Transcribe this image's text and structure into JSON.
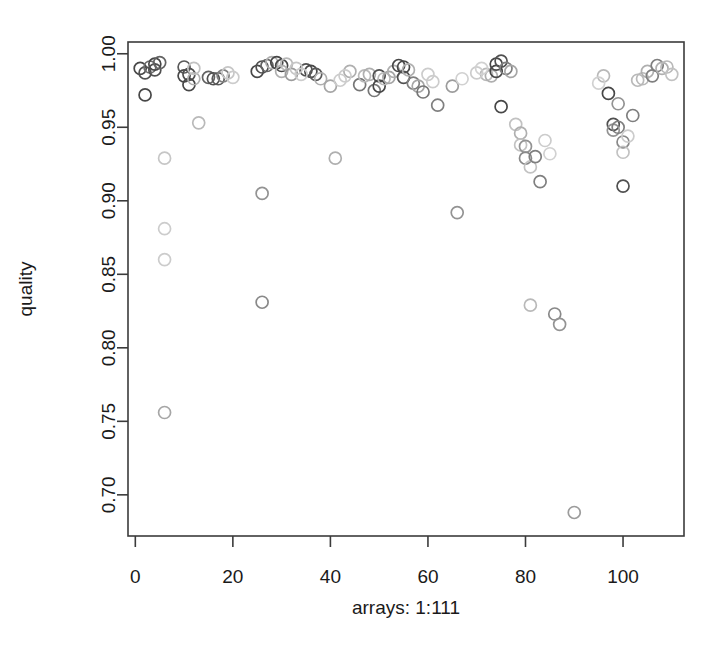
{
  "chart_data": {
    "type": "scatter",
    "title": "",
    "xlabel": "arrays: 1:111",
    "ylabel": "quality",
    "xlim": [
      -1.5,
      112.5
    ],
    "ylim": [
      0.672,
      1.008
    ],
    "xticks": [
      0,
      20,
      40,
      60,
      80,
      100
    ],
    "xtick_labels": [
      "0",
      "20",
      "40",
      "60",
      "80",
      "100"
    ],
    "yticks": [
      0.7,
      0.75,
      0.8,
      0.85,
      0.9,
      0.95,
      1.0
    ],
    "ytick_labels": [
      "0.70",
      "0.75",
      "0.80",
      "0.85",
      "0.90",
      "0.95",
      "1.00"
    ],
    "grid": false,
    "legend": null,
    "marker": "open-circle",
    "point_radius_px": 6,
    "note": "Point shading varies from light grey to dark grey; darkness encoded per point as 'shade' (0 = lightest, 1 = darkest).",
    "points": [
      {
        "x": 1,
        "y": 0.99,
        "shade": 0.85
      },
      {
        "x": 2,
        "y": 0.987,
        "shade": 0.8
      },
      {
        "x": 2,
        "y": 0.972,
        "shade": 0.85
      },
      {
        "x": 3,
        "y": 0.991,
        "shade": 0.65
      },
      {
        "x": 4,
        "y": 0.993,
        "shade": 0.85
      },
      {
        "x": 4,
        "y": 0.989,
        "shade": 0.8
      },
      {
        "x": 5,
        "y": 0.994,
        "shade": 0.7
      },
      {
        "x": 6,
        "y": 0.929,
        "shade": 0.18
      },
      {
        "x": 6,
        "y": 0.881,
        "shade": 0.15
      },
      {
        "x": 6,
        "y": 0.86,
        "shade": 0.15
      },
      {
        "x": 6,
        "y": 0.756,
        "shade": 0.35
      },
      {
        "x": 10,
        "y": 0.991,
        "shade": 0.75
      },
      {
        "x": 10,
        "y": 0.985,
        "shade": 0.85
      },
      {
        "x": 11,
        "y": 0.986,
        "shade": 0.8
      },
      {
        "x": 11,
        "y": 0.979,
        "shade": 0.85
      },
      {
        "x": 12,
        "y": 0.983,
        "shade": 0.3
      },
      {
        "x": 13,
        "y": 0.953,
        "shade": 0.25
      },
      {
        "x": 15,
        "y": 0.984,
        "shade": 0.7
      },
      {
        "x": 16,
        "y": 0.983,
        "shade": 0.8
      },
      {
        "x": 17,
        "y": 0.983,
        "shade": 0.75
      },
      {
        "x": 18,
        "y": 0.985,
        "shade": 0.55
      },
      {
        "x": 25,
        "y": 0.988,
        "shade": 0.85
      },
      {
        "x": 26,
        "y": 0.991,
        "shade": 0.8
      },
      {
        "x": 26,
        "y": 0.905,
        "shade": 0.45
      },
      {
        "x": 26,
        "y": 0.831,
        "shade": 0.5
      },
      {
        "x": 27,
        "y": 0.992,
        "shade": 0.7
      },
      {
        "x": 28,
        "y": 0.994,
        "shade": 0.3
      },
      {
        "x": 29,
        "y": 0.994,
        "shade": 0.85
      },
      {
        "x": 30,
        "y": 0.992,
        "shade": 0.85
      },
      {
        "x": 30,
        "y": 0.988,
        "shade": 0.3
      },
      {
        "x": 31,
        "y": 0.993,
        "shade": 0.25
      },
      {
        "x": 32,
        "y": 0.986,
        "shade": 0.4
      },
      {
        "x": 35,
        "y": 0.989,
        "shade": 0.8
      },
      {
        "x": 36,
        "y": 0.988,
        "shade": 0.85
      },
      {
        "x": 37,
        "y": 0.986,
        "shade": 0.75
      },
      {
        "x": 38,
        "y": 0.983,
        "shade": 0.3
      },
      {
        "x": 40,
        "y": 0.978,
        "shade": 0.35
      },
      {
        "x": 41,
        "y": 0.929,
        "shade": 0.3
      },
      {
        "x": 44,
        "y": 0.988,
        "shade": 0.3
      },
      {
        "x": 46,
        "y": 0.979,
        "shade": 0.6
      },
      {
        "x": 47,
        "y": 0.985,
        "shade": 0.25
      },
      {
        "x": 48,
        "y": 0.986,
        "shade": 0.3
      },
      {
        "x": 49,
        "y": 0.975,
        "shade": 0.6
      },
      {
        "x": 50,
        "y": 0.985,
        "shade": 0.8
      },
      {
        "x": 50,
        "y": 0.978,
        "shade": 0.85
      },
      {
        "x": 51,
        "y": 0.983,
        "shade": 0.25
      },
      {
        "x": 52,
        "y": 0.984,
        "shade": 0.35
      },
      {
        "x": 53,
        "y": 0.988,
        "shade": 0.3
      },
      {
        "x": 54,
        "y": 0.992,
        "shade": 0.85
      },
      {
        "x": 55,
        "y": 0.991,
        "shade": 0.85
      },
      {
        "x": 55,
        "y": 0.984,
        "shade": 0.8
      },
      {
        "x": 56,
        "y": 0.989,
        "shade": 0.3
      },
      {
        "x": 57,
        "y": 0.98,
        "shade": 0.55
      },
      {
        "x": 58,
        "y": 0.978,
        "shade": 0.35
      },
      {
        "x": 59,
        "y": 0.974,
        "shade": 0.6
      },
      {
        "x": 62,
        "y": 0.965,
        "shade": 0.55
      },
      {
        "x": 65,
        "y": 0.978,
        "shade": 0.4
      },
      {
        "x": 66,
        "y": 0.892,
        "shade": 0.45
      },
      {
        "x": 72,
        "y": 0.986,
        "shade": 0.25
      },
      {
        "x": 73,
        "y": 0.985,
        "shade": 0.3
      },
      {
        "x": 74,
        "y": 0.993,
        "shade": 0.85
      },
      {
        "x": 74,
        "y": 0.988,
        "shade": 0.85
      },
      {
        "x": 75,
        "y": 0.995,
        "shade": 0.8
      },
      {
        "x": 75,
        "y": 0.964,
        "shade": 0.85
      },
      {
        "x": 76,
        "y": 0.99,
        "shade": 0.55
      },
      {
        "x": 77,
        "y": 0.988,
        "shade": 0.35
      },
      {
        "x": 78,
        "y": 0.952,
        "shade": 0.2
      },
      {
        "x": 79,
        "y": 0.946,
        "shade": 0.3
      },
      {
        "x": 79,
        "y": 0.938,
        "shade": 0.2
      },
      {
        "x": 80,
        "y": 0.937,
        "shade": 0.45
      },
      {
        "x": 80,
        "y": 0.929,
        "shade": 0.5
      },
      {
        "x": 81,
        "y": 0.923,
        "shade": 0.2
      },
      {
        "x": 81,
        "y": 0.829,
        "shade": 0.25
      },
      {
        "x": 82,
        "y": 0.93,
        "shade": 0.55
      },
      {
        "x": 83,
        "y": 0.913,
        "shade": 0.55
      },
      {
        "x": 86,
        "y": 0.823,
        "shade": 0.5
      },
      {
        "x": 87,
        "y": 0.816,
        "shade": 0.45
      },
      {
        "x": 90,
        "y": 0.688,
        "shade": 0.4
      },
      {
        "x": 96,
        "y": 0.985,
        "shade": 0.25
      },
      {
        "x": 97,
        "y": 0.973,
        "shade": 0.85
      },
      {
        "x": 98,
        "y": 0.952,
        "shade": 0.8
      },
      {
        "x": 98,
        "y": 0.948,
        "shade": 0.45
      },
      {
        "x": 99,
        "y": 0.966,
        "shade": 0.45
      },
      {
        "x": 99,
        "y": 0.95,
        "shade": 0.55
      },
      {
        "x": 100,
        "y": 0.94,
        "shade": 0.5
      },
      {
        "x": 100,
        "y": 0.933,
        "shade": 0.2
      },
      {
        "x": 100,
        "y": 0.91,
        "shade": 0.8
      },
      {
        "x": 102,
        "y": 0.958,
        "shade": 0.55
      },
      {
        "x": 103,
        "y": 0.982,
        "shade": 0.25
      },
      {
        "x": 104,
        "y": 0.983,
        "shade": 0.25
      },
      {
        "x": 105,
        "y": 0.988,
        "shade": 0.3
      },
      {
        "x": 106,
        "y": 0.985,
        "shade": 0.55
      },
      {
        "x": 107,
        "y": 0.992,
        "shade": 0.55
      },
      {
        "x": 108,
        "y": 0.99,
        "shade": 0.3
      },
      {
        "x": 109,
        "y": 0.991,
        "shade": 0.25
      },
      {
        "x": 110,
        "y": 0.986,
        "shade": 0.2
      },
      {
        "x": 12,
        "y": 0.99,
        "shade": 0.2
      },
      {
        "x": 19,
        "y": 0.987,
        "shade": 0.18
      },
      {
        "x": 20,
        "y": 0.984,
        "shade": 0.15
      },
      {
        "x": 33,
        "y": 0.99,
        "shade": 0.18
      },
      {
        "x": 34,
        "y": 0.986,
        "shade": 0.15
      },
      {
        "x": 42,
        "y": 0.982,
        "shade": 0.15
      },
      {
        "x": 43,
        "y": 0.985,
        "shade": 0.15
      },
      {
        "x": 60,
        "y": 0.986,
        "shade": 0.15
      },
      {
        "x": 61,
        "y": 0.981,
        "shade": 0.15
      },
      {
        "x": 67,
        "y": 0.983,
        "shade": 0.12
      },
      {
        "x": 70,
        "y": 0.987,
        "shade": 0.15
      },
      {
        "x": 71,
        "y": 0.99,
        "shade": 0.12
      },
      {
        "x": 84,
        "y": 0.941,
        "shade": 0.15
      },
      {
        "x": 85,
        "y": 0.932,
        "shade": 0.12
      },
      {
        "x": 101,
        "y": 0.944,
        "shade": 0.15
      },
      {
        "x": 95,
        "y": 0.98,
        "shade": 0.12
      }
    ]
  },
  "axes": {
    "x_axis_title": "arrays: 1:111",
    "y_axis_title": "quality"
  },
  "colors": {
    "frame": "#3b3b3b",
    "text": "#1a1a1a",
    "point_dark": "#2e2e2e",
    "point_light": "#e2e2e2",
    "background": "#ffffff"
  }
}
